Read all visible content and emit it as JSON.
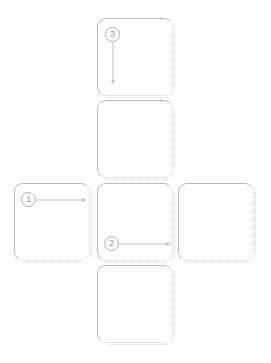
{
  "diagram": {
    "background_color": "#ffffff",
    "card_border_color": "#b9b9b9",
    "card_dotted_color": "#cfcfcf",
    "badge_color": "#9a9a9a",
    "arrow_color": "#c2c2c2",
    "cards": [
      {
        "id": "card-top",
        "label": ""
      },
      {
        "id": "card-middle",
        "label": ""
      },
      {
        "id": "card-left",
        "label": ""
      },
      {
        "id": "card-center",
        "label": ""
      },
      {
        "id": "card-right",
        "label": ""
      },
      {
        "id": "card-bottom",
        "label": ""
      }
    ],
    "steps": [
      {
        "number": "1",
        "direction": "right"
      },
      {
        "number": "2",
        "direction": "right"
      },
      {
        "number": "3",
        "direction": "down"
      }
    ]
  }
}
